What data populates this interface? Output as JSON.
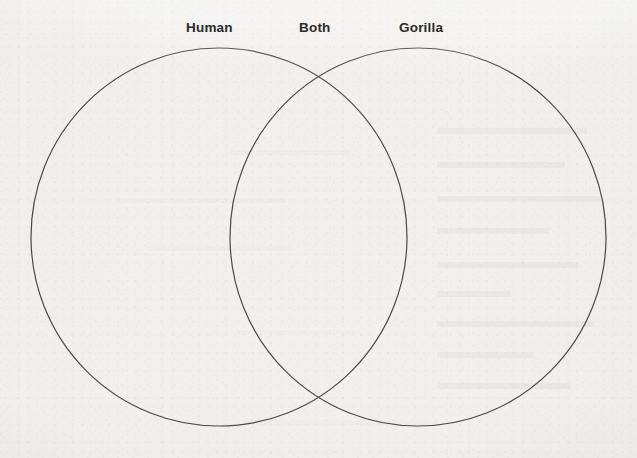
{
  "document": {
    "type": "venn-diagram-worksheet",
    "background_color": "#f2f1ef",
    "stroke_color": "#4a4a4a",
    "text_color": "#2b2b2b"
  },
  "chart_data": {
    "type": "diagram",
    "subtype": "venn",
    "title": "",
    "sets": [
      {
        "name": "Human",
        "region": "left-only",
        "items": []
      },
      {
        "name": "Gorilla",
        "region": "right-only",
        "items": []
      }
    ],
    "intersection": {
      "name": "Both",
      "region": "overlap",
      "items": []
    },
    "labels": [
      "Human",
      "Both",
      "Gorilla"
    ],
    "filled": false
  },
  "labels": {
    "left": "Human",
    "overlap": "Both",
    "right": "Gorilla"
  },
  "geometry": {
    "left_ellipse": {
      "cx": 219,
      "cy": 237,
      "rx": 188,
      "ry": 189
    },
    "right_ellipse": {
      "cx": 418,
      "cy": 237,
      "rx": 188,
      "ry": 189
    },
    "stroke_width": 1.2
  }
}
